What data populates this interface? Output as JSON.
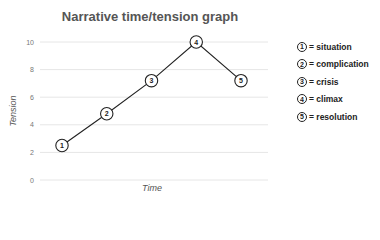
{
  "chart_data": {
    "type": "line",
    "title": "Narrative time/tension graph",
    "xlabel": "Time",
    "ylabel": "Tension",
    "ylim": [
      0,
      10
    ],
    "yticks": [
      0,
      2,
      4,
      6,
      8,
      10
    ],
    "grid": true,
    "legend_position": "right",
    "points": [
      {
        "label": "1",
        "x": 1,
        "y": 2.5,
        "name": "situation"
      },
      {
        "label": "2",
        "x": 2,
        "y": 4.8,
        "name": "complication"
      },
      {
        "label": "3",
        "x": 3,
        "y": 7.2,
        "name": "crisis"
      },
      {
        "label": "4",
        "x": 4,
        "y": 10,
        "name": "climax"
      },
      {
        "label": "5",
        "x": 5,
        "y": 7.2,
        "name": "resolution"
      }
    ]
  },
  "legend": [
    {
      "num": "1",
      "text": "= situation"
    },
    {
      "num": "2",
      "text": "= complication"
    },
    {
      "num": "3",
      "text": "= crisis"
    },
    {
      "num": "4",
      "text": "= climax"
    },
    {
      "num": "5",
      "text": "= resolution"
    }
  ]
}
